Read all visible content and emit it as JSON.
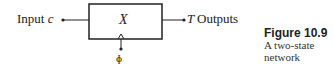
{
  "diagram": {
    "input": {
      "label": "Input",
      "variable": "c"
    },
    "block": {
      "label": "X"
    },
    "output": {
      "variable": "T",
      "label": "Outputs"
    },
    "clock": {
      "symbol": "ɸ"
    },
    "colors": {
      "stroke": "#222222",
      "background": "#ffffff"
    }
  },
  "caption": {
    "title": "Figure 10.9",
    "line1": "A two-state",
    "line2": "network"
  }
}
